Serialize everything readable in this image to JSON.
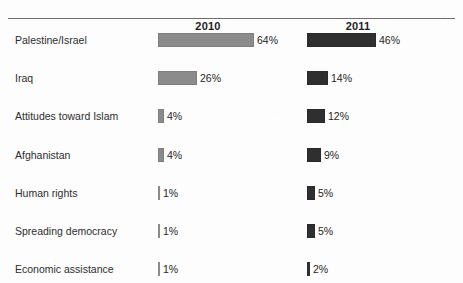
{
  "chart_data": {
    "type": "bar",
    "orientation": "horizontal",
    "title": "",
    "xlabel": "",
    "ylabel": "",
    "xlim": [
      0,
      70
    ],
    "grid": false,
    "legend_position": "top-column-headers",
    "categories": [
      "Palestine/Israel",
      "Iraq",
      "Attitudes toward Islam",
      "Afghanistan",
      "Human rights",
      "Spreading democracy",
      "Economic assistance"
    ],
    "series": [
      {
        "name": "2010",
        "color": "#8b8b8b",
        "values": [
          64,
          26,
          4,
          4,
          1,
          1,
          1
        ],
        "labels": [
          "64%",
          "26%",
          "4%",
          "4%",
          "1%",
          "1%",
          "1%"
        ]
      },
      {
        "name": "2011",
        "color": "#2f2f2f",
        "values": [
          46,
          14,
          12,
          9,
          5,
          5,
          2
        ],
        "labels": [
          "46%",
          "14%",
          "12%",
          "9%",
          "5%",
          "5%",
          "2%"
        ]
      }
    ]
  },
  "header": {
    "col_2010": "2010",
    "col_2011": "2011"
  },
  "rows": [
    {
      "label": "Palestine/Israel",
      "v2010": 64,
      "l2010": "64%",
      "v2011": 46,
      "l2011": "46%"
    },
    {
      "label": "Iraq",
      "v2010": 26,
      "l2010": "26%",
      "v2011": 14,
      "l2011": "14%"
    },
    {
      "label": "Attitudes toward Islam",
      "v2010": 4,
      "l2010": "4%",
      "v2011": 12,
      "l2011": "12%"
    },
    {
      "label": "Afghanistan",
      "v2010": 4,
      "l2010": "4%",
      "v2011": 9,
      "l2011": "9%"
    },
    {
      "label": "Human rights",
      "v2010": 1,
      "l2010": "1%",
      "v2011": 5,
      "l2011": "5%"
    },
    {
      "label": "Spreading democracy",
      "v2010": 1,
      "l2010": "1%",
      "v2011": 5,
      "l2011": "5%"
    },
    {
      "label": "Economic assistance",
      "v2010": 1,
      "l2010": "1%",
      "v2011": 2,
      "l2011": "2%"
    }
  ],
  "colors": {
    "series_2010": "#8b8b8b",
    "series_2011": "#2f2f2f",
    "rule": "#6e6e6e",
    "text": "#2d2d2d",
    "background": "#fdfdfd"
  }
}
